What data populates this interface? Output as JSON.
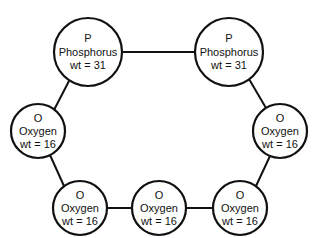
{
  "diagram": {
    "type": "molecule-ring",
    "atoms": [
      {
        "id": "p1",
        "symbol": "P",
        "name": "Phosphorus",
        "weight": "wt = 31",
        "cx": 88,
        "cy": 52,
        "r": 34
      },
      {
        "id": "p2",
        "symbol": "P",
        "name": "Phosphorus",
        "weight": "wt = 31",
        "cx": 229,
        "cy": 52,
        "r": 34
      },
      {
        "id": "o-left",
        "symbol": "O",
        "name": "Oxygen",
        "weight": "wt = 16",
        "cx": 38,
        "cy": 131,
        "r": 27
      },
      {
        "id": "o-right",
        "symbol": "O",
        "name": "Oxygen",
        "weight": "wt = 16",
        "cx": 280,
        "cy": 131,
        "r": 27
      },
      {
        "id": "o-bottom-left",
        "symbol": "O",
        "name": "Oxygen",
        "weight": "wt = 16",
        "cx": 80,
        "cy": 208,
        "r": 27
      },
      {
        "id": "o-bottom-middle",
        "symbol": "O",
        "name": "Oxygen",
        "weight": "wt = 16",
        "cx": 159,
        "cy": 208,
        "r": 27
      },
      {
        "id": "o-bottom-right",
        "symbol": "O",
        "name": "Oxygen",
        "weight": "wt = 16",
        "cx": 240,
        "cy": 208,
        "r": 27
      }
    ],
    "bonds": [
      [
        "p1",
        "p2"
      ],
      [
        "p2",
        "o-right"
      ],
      [
        "o-right",
        "o-bottom-right"
      ],
      [
        "o-bottom-right",
        "o-bottom-middle"
      ],
      [
        "o-bottom-middle",
        "o-bottom-left"
      ],
      [
        "o-bottom-left",
        "o-left"
      ],
      [
        "o-left",
        "p1"
      ]
    ]
  }
}
